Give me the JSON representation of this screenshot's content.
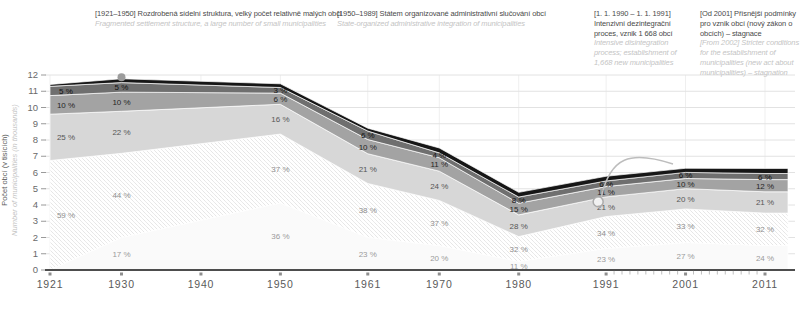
{
  "figure": {
    "y_axis_label_cz": "Počet obcí (v tisících)",
    "y_axis_label_en": "Number of municipalities (in thousands)"
  },
  "annotations": [
    {
      "cz": "[1921–1950] Rozdrobená sídelní struktura, velký počet relativně malých obcí",
      "en": "Fragmented settlement structure, a large number of small municipalities"
    },
    {
      "cz": "[1950–1989] Státem organizované administrativní slučování obcí",
      "en": "State-organized administrative integration of municipalities"
    },
    {
      "cz": "[1. 1. 1990 – 1. 1. 1991] Intenzivní dezintegrační proces, vznik 1 668 obcí",
      "en": "Intensive disintegration process; establishment of 1,668 new municipalities"
    },
    {
      "cz": "[Od 2001] Přísnější podmínky pro vznik obcí (nový zákon o obcích) – stagnace",
      "en": "[From 2002] Stricter conditions for the establishment of municipalities (new act about municipalities) – stagnation"
    }
  ],
  "chart_data": {
    "type": "area",
    "stacked": true,
    "title": "",
    "xlabel": "",
    "ylabel_cz": "Počet obcí (v tisících)",
    "ylabel_en": "Number of municipalities (in thousands)",
    "x": [
      1921,
      1930,
      1950,
      1961,
      1970,
      1980,
      1991,
      2001,
      2011
    ],
    "x_tick_labels": [
      "1921",
      "1930",
      "1940",
      "1950",
      "1961",
      "1970",
      "1980",
      "1991",
      "2001",
      "2011"
    ],
    "x_tick_years": [
      1921,
      1930,
      1940,
      1950,
      1961,
      1970,
      1980,
      1991,
      2001,
      2011
    ],
    "minor_tick_years_range": [
      1992,
      2010
    ],
    "totals_in_thousands": [
      11.417,
      11.768,
      11.459,
      8.726,
      7.509,
      4.778,
      5.768,
      6.258,
      6.251
    ],
    "ylim": [
      0,
      12
    ],
    "y_ticks": [
      0,
      1,
      2,
      3,
      4,
      5,
      6,
      7,
      8,
      9,
      10,
      11,
      12
    ],
    "grid": true,
    "label_suffix": " %",
    "series": [
      {
        "name": "band-1",
        "fill": "#fafafa",
        "pattern": "none",
        "labeled": true,
        "label_color": "#9b9b9b",
        "pct": [
          0,
          17,
          36,
          23,
          20,
          11,
          23,
          27,
          24
        ]
      },
      {
        "name": "band-2",
        "fill": "hatch",
        "pattern": "hatch",
        "labeled": true,
        "label_color": "#8f8f8f",
        "pct": [
          59,
          44,
          37,
          38,
          37,
          32,
          34,
          33,
          32
        ]
      },
      {
        "name": "band-3",
        "fill": "#d7d7d7",
        "pattern": "none",
        "labeled": true,
        "label_color": "#565656",
        "pct": [
          25,
          22,
          16,
          21,
          24,
          28,
          21,
          20,
          21
        ]
      },
      {
        "name": "band-4",
        "fill": "#a3a3a3",
        "pattern": "none",
        "labeled": true,
        "label_color": "#262626",
        "pct": [
          10,
          10,
          6,
          10,
          11,
          15,
          11,
          10,
          12
        ]
      },
      {
        "name": "band-5",
        "fill": "#6f6f6f",
        "pattern": "none",
        "labeled": true,
        "label_color": "#111111",
        "pct": [
          5,
          5,
          3,
          6,
          4,
          8,
          6,
          6,
          6
        ]
      },
      {
        "name": "band-6-top",
        "fill": "#161616",
        "pattern": "none",
        "labeled": false,
        "label_color": "#ffffff",
        "pct": [
          1,
          2,
          2,
          2,
          4,
          6,
          5,
          4,
          5
        ]
      }
    ],
    "markers": [
      {
        "year": 1930,
        "value": 11.768,
        "style": "filled"
      },
      {
        "year": 1990,
        "value": 4.2,
        "style": "open"
      }
    ],
    "colors": {
      "grid": "#e2e2e2",
      "vgrid": "#efefef",
      "axis": "#4d4d4d",
      "tick_label": "#6a6a6a",
      "year_label": "#5a5a5a",
      "hatch_line": "#e4e4e4",
      "marker_filled": "#9c9c9c",
      "marker_open_stroke": "#ababab",
      "leader": "#bdbdbd"
    }
  }
}
